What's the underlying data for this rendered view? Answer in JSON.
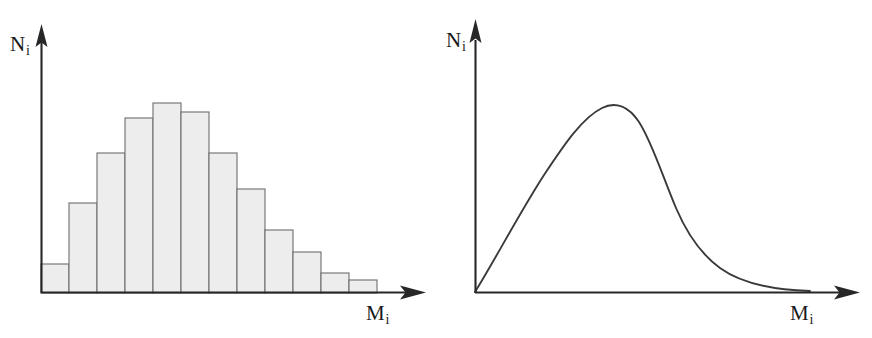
{
  "figure": {
    "background_color": "#ffffff",
    "ink_color": "#272727",
    "panels": [
      {
        "id": "histogram",
        "name": "discrete-mass-distribution-histogram",
        "y_axis_label": "N",
        "y_axis_subscript": "i",
        "x_axis_label": "M",
        "x_axis_subscript": "i"
      },
      {
        "id": "curve",
        "name": "continuous-mass-distribution-curve",
        "y_axis_label": "N",
        "y_axis_subscript": "i",
        "x_axis_label": "M",
        "x_axis_subscript": "i"
      }
    ]
  },
  "chart_data": [
    {
      "type": "bar",
      "id": "histogram",
      "title": "",
      "xlabel": "M_i",
      "ylabel": "N_i",
      "grid": false,
      "legend": "none",
      "axis_arrows": true,
      "tick_labels_x": [],
      "tick_labels_y": [],
      "bar_fill": "#ededed",
      "bar_stroke": "#6d6d6d",
      "categories": [
        "1",
        "2",
        "3",
        "4",
        "5",
        "6",
        "7",
        "8",
        "9",
        "10",
        "11",
        "12"
      ],
      "values": [
        29,
        90,
        140,
        175,
        190,
        181,
        140,
        104,
        63,
        41,
        20,
        13
      ],
      "ylim": [
        0,
        268
      ],
      "xlim": [
        0,
        12
      ],
      "bar_left_px": [
        41,
        69,
        97,
        125,
        153,
        181,
        209,
        237,
        265,
        293,
        321,
        349
      ],
      "bar_width_px": 28,
      "baseline_px": 293,
      "bar_top_px": [
        264,
        203,
        153,
        118,
        103,
        112,
        153,
        189,
        230,
        252,
        273,
        280
      ]
    },
    {
      "type": "line",
      "id": "curve",
      "title": "",
      "xlabel": "M_i",
      "ylabel": "N_i",
      "grid": false,
      "legend": "none",
      "axis_arrows": true,
      "tick_labels_x": [],
      "tick_labels_y": [],
      "line_color": "#3a3a3a",
      "description": "smooth right-skewed unimodal distribution rising from the origin to a peak then decaying asymptotically toward the x-axis",
      "x": [
        0,
        10,
        20,
        30,
        40,
        50,
        60,
        70,
        80,
        90,
        100
      ],
      "y": [
        0,
        55,
        112,
        163,
        188,
        177,
        140,
        98,
        62,
        35,
        14
      ],
      "peak_x": 38,
      "peak_y": 188,
      "ylim": [
        0,
        268
      ],
      "xlim": [
        0,
        105
      ]
    }
  ]
}
